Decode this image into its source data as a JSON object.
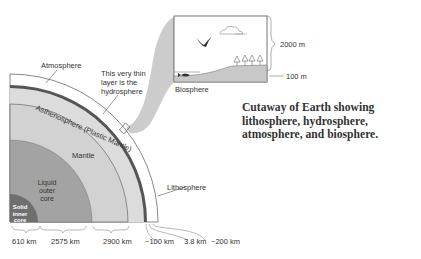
{
  "caption": {
    "line1": "Cutaway of Earth showing",
    "line2": "lithosphere, hydrosphere,",
    "line3": "atmosphere, and biosphere."
  },
  "layers": {
    "atmosphere": "Atmosphere",
    "hydrosphere_note": "This very thin layer is the hydrosphere",
    "asthenosphere": "Asthenosphere (Plastic Mantle)",
    "mantle": "Mantle",
    "outer_core": "Liquid outer core",
    "inner_core": "Solid inner core",
    "lithosphere": "Lithosphere",
    "biosphere": "Biosphere"
  },
  "inset": {
    "height_top": "2000 m",
    "height_bottom": "100 m"
  },
  "thicknesses": [
    {
      "label": "610 km",
      "layer": "inner_core"
    },
    {
      "label": "2575 km",
      "layer": "outer_core"
    },
    {
      "label": "2900 km",
      "layer": "mantle"
    },
    {
      "label": "~100 km",
      "layer": "lithosphere"
    },
    {
      "label": "3.8 km",
      "layer": "hydrosphere"
    },
    {
      "label": "~200 km",
      "layer": "atmosphere"
    }
  ],
  "colors": {
    "inner_core": "#6f6f6f",
    "outer_core": "#a3a3a3",
    "mantle": "#cfcfcf",
    "asthenosphere": "#dcdcdc",
    "lithosphere_band": "#555555",
    "atmosphere": "#ffffff",
    "funnel": "#cccccc",
    "ground": "#c8c8c8",
    "text": "#333333"
  }
}
